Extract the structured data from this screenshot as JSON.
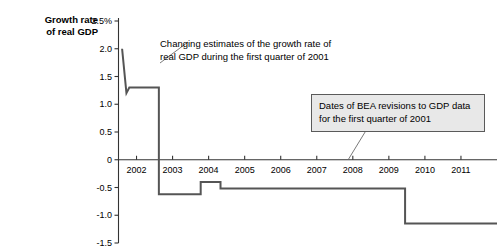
{
  "chart_data": {
    "type": "line",
    "title": "",
    "subtitle": "",
    "ylabel": "Growth rate of real GDP",
    "xlabel": "",
    "grid": false,
    "legend": "none",
    "ylim": [
      -1.5,
      2.5
    ],
    "xlim": [
      2001.5,
      2012.0
    ],
    "ytick_labels": [
      "2.5%",
      "2.0",
      "1.5",
      "1.0",
      "0.5",
      "0",
      "-0.5",
      "-1.0",
      "-1.5"
    ],
    "ytick_values": [
      2.5,
      2.0,
      1.5,
      1.0,
      0.5,
      0,
      -0.5,
      -1.0,
      -1.5
    ],
    "xtick_labels": [
      "2002",
      "2003",
      "2004",
      "2005",
      "2006",
      "2007",
      "2008",
      "2009",
      "2010",
      "2011"
    ],
    "xtick_values": [
      2002,
      2003,
      2004,
      2005,
      2006,
      2007,
      2008,
      2009,
      2010,
      2011
    ],
    "series": [
      {
        "name": "Growth rate of real GDP, first quarter of 2001 (successive BEA estimates)",
        "step": "post",
        "color": "#555555",
        "x": [
          2001.6,
          2001.72,
          2001.8,
          2002.62,
          2002.62,
          2003.78,
          2003.78,
          2004.33,
          2004.33,
          2009.45,
          2009.45,
          2012.0
        ],
        "y": [
          2.0,
          1.2,
          1.3,
          1.3,
          -0.62,
          -0.62,
          -0.4,
          -0.4,
          -0.52,
          -0.52,
          -1.15,
          -1.15
        ]
      }
    ],
    "annotations": [
      {
        "id": "annotation-1",
        "text": "Changing estimates of the growth rate of\nreal GDP during the first quarter of 2001",
        "boxed": false,
        "leader_from": [
          160,
          63
        ],
        "leader_to": [
          188,
          42
        ]
      },
      {
        "id": "annotation-2",
        "text": "Dates of BEA revisions to GDP data\nfor the first quarter of 2001",
        "boxed": true,
        "box_fill": "#e8e8e8",
        "box_border": "#5a5a5a",
        "leader_from": [
          348,
          160
        ],
        "leader_to": [
          370,
          124
        ]
      }
    ]
  },
  "axis": {
    "y_title": "Growth rate\nof real GDP"
  },
  "colors": {
    "line": "#555555",
    "axis": "#333333",
    "box_fill": "#e8e8e8",
    "box_border": "#5a5a5a",
    "text": "#000000"
  }
}
